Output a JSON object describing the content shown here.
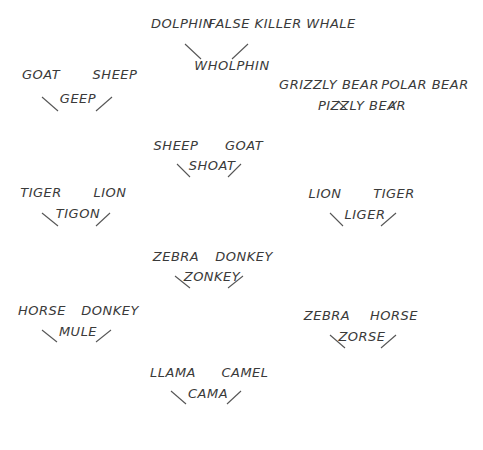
{
  "crosses": [
    {
      "id": "wholphin",
      "parents": [
        "DOLPHIN",
        "FALSE KILLER WHALE"
      ],
      "child": "WHOLPHIN",
      "p1": [
        182,
        24
      ],
      "p2": [
        282,
        24
      ],
      "c": [
        232,
        66
      ],
      "l1": [
        185,
        44,
        201,
        59
      ],
      "l2": [
        248,
        44,
        232,
        59
      ]
    },
    {
      "id": "geep",
      "parents": [
        "GOAT",
        "SHEEP"
      ],
      "child": "GEEP",
      "p1": [
        41,
        75
      ],
      "p2": [
        115,
        75
      ],
      "c": [
        78,
        99
      ],
      "l1": [
        42,
        97,
        58,
        111
      ],
      "l2": [
        112,
        97,
        96,
        111
      ]
    },
    {
      "id": "pizzly",
      "parents": [
        "GRIZZLY BEAR",
        "POLAR BEAR"
      ],
      "child": "PIZZLY BEAR",
      "p1": [
        329,
        85
      ],
      "p2": [
        425,
        85
      ],
      "c": [
        362,
        106
      ],
      "l1": [
        338,
        101,
        346,
        109
      ],
      "l2": [
        397,
        101,
        389,
        109
      ]
    },
    {
      "id": "shoat",
      "parents": [
        "SHEEP",
        "GOAT"
      ],
      "child": "SHOAT",
      "p1": [
        176,
        146
      ],
      "p2": [
        244,
        146
      ],
      "c": [
        212,
        166
      ],
      "l1": [
        177,
        164,
        190,
        177
      ],
      "l2": [
        241,
        164,
        228,
        177
      ]
    },
    {
      "id": "tigon",
      "parents": [
        "TIGER",
        "LION"
      ],
      "child": "TIGON",
      "p1": [
        41,
        193
      ],
      "p2": [
        110,
        193
      ],
      "c": [
        78,
        214
      ],
      "l1": [
        42,
        213,
        58,
        226
      ],
      "l2": [
        110,
        213,
        96,
        226
      ]
    },
    {
      "id": "liger",
      "parents": [
        "LION",
        "TIGER"
      ],
      "child": "LIGER",
      "p1": [
        325,
        194
      ],
      "p2": [
        394,
        194
      ],
      "c": [
        365,
        215
      ],
      "l1": [
        330,
        213,
        343,
        226
      ],
      "l2": [
        396,
        213,
        381,
        226
      ]
    },
    {
      "id": "zonkey",
      "parents": [
        "ZEBRA",
        "DONKEY"
      ],
      "child": "ZONKEY",
      "p1": [
        176,
        257
      ],
      "p2": [
        244,
        257
      ],
      "c": [
        212,
        277
      ],
      "l1": [
        175,
        276,
        190,
        288
      ],
      "l2": [
        243,
        276,
        228,
        288
      ]
    },
    {
      "id": "mule",
      "parents": [
        "HORSE",
        "DONKEY"
      ],
      "child": "MULE",
      "p1": [
        42,
        311
      ],
      "p2": [
        110,
        311
      ],
      "c": [
        78,
        332
      ],
      "l1": [
        42,
        330,
        57,
        342
      ],
      "l2": [
        111,
        330,
        96,
        342
      ]
    },
    {
      "id": "zorse",
      "parents": [
        "ZEBRA",
        "HORSE"
      ],
      "child": "ZORSE",
      "p1": [
        327,
        316
      ],
      "p2": [
        394,
        316
      ],
      "c": [
        362,
        337
      ],
      "l1": [
        330,
        335,
        345,
        348
      ],
      "l2": [
        396,
        335,
        381,
        348
      ]
    },
    {
      "id": "cama",
      "parents": [
        "LLAMA",
        "CAMEL"
      ],
      "child": "CAMA",
      "p1": [
        173,
        373
      ],
      "p2": [
        245,
        373
      ],
      "c": [
        208,
        394
      ],
      "l1": [
        171,
        391,
        186,
        404
      ],
      "l2": [
        241,
        391,
        227,
        404
      ]
    }
  ]
}
